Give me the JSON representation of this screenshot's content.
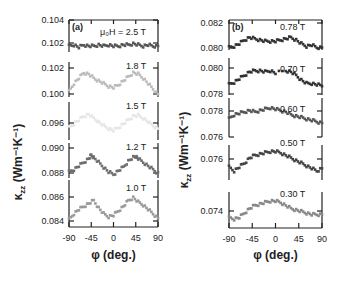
{
  "chart_data": [
    {
      "type": "scatter",
      "panel": "(a)",
      "xlabel": "φ (deg.)",
      "ylabel": "κzz (Wm⁻¹K⁻¹)",
      "xlim": [
        -90,
        90
      ],
      "xticks": [
        -90,
        -45,
        0,
        45,
        90
      ],
      "field_prefix": "μ₀H = ",
      "series": [
        {
          "name": "2.5 T",
          "color": "#555555",
          "ylim": [
            0.1015,
            0.1042
          ],
          "yticks": [
            0.104,
            0.102
          ],
          "x": [
            -90,
            -80,
            -70,
            -60,
            -50,
            -40,
            -30,
            -20,
            -10,
            0,
            10,
            20,
            30,
            40,
            50,
            60,
            70,
            80,
            90
          ],
          "y": [
            0.102,
            0.1021,
            0.1019,
            0.1021,
            0.102,
            0.102,
            0.1021,
            0.102,
            0.1021,
            0.102,
            0.102,
            0.1021,
            0.1021,
            0.1022,
            0.1021,
            0.102,
            0.1021,
            0.102,
            0.102
          ]
        },
        {
          "name": "1.8 T",
          "color": "#bbbbbb",
          "ylim": [
            0.0998,
            0.1024
          ],
          "yticks": [
            0.102,
            0.1
          ],
          "x": [
            -90,
            -80,
            -70,
            -60,
            -50,
            -40,
            -30,
            -20,
            -10,
            0,
            10,
            20,
            30,
            40,
            50,
            60,
            70,
            80,
            90
          ],
          "y": [
            0.1002,
            0.1008,
            0.1012,
            0.1016,
            0.1015,
            0.1012,
            0.101,
            0.1008,
            0.1006,
            0.1005,
            0.1007,
            0.101,
            0.1013,
            0.1016,
            0.1015,
            0.1012,
            0.1008,
            0.1004,
            0.1
          ]
        },
        {
          "name": "1.5 T",
          "color": "#e6e6e6",
          "ylim": [
            0.0945,
            0.0985
          ],
          "yticks": [
            0.096
          ],
          "x": [
            -90,
            -80,
            -70,
            -60,
            -50,
            -40,
            -30,
            -20,
            -10,
            0,
            10,
            20,
            30,
            40,
            50,
            60,
            70,
            80,
            90
          ],
          "y": [
            0.0958,
            0.0962,
            0.0966,
            0.097,
            0.0972,
            0.0968,
            0.0964,
            0.096,
            0.0957,
            0.0955,
            0.0958,
            0.0962,
            0.0966,
            0.097,
            0.0971,
            0.0968,
            0.0964,
            0.096,
            0.0957
          ]
        },
        {
          "name": "1.2 T",
          "color": "#6e6e6e",
          "ylim": [
            0.0875,
            0.0904
          ],
          "yticks": [
            0.09,
            0.088
          ],
          "x": [
            -90,
            -80,
            -70,
            -60,
            -50,
            -45,
            -40,
            -30,
            -20,
            -10,
            0,
            10,
            20,
            30,
            40,
            45,
            50,
            60,
            70,
            80,
            90
          ],
          "y": [
            0.088,
            0.0882,
            0.0885,
            0.0888,
            0.0891,
            0.0894,
            0.0892,
            0.0888,
            0.0884,
            0.088,
            0.0878,
            0.0881,
            0.0884,
            0.0889,
            0.0892,
            0.0893,
            0.0891,
            0.0888,
            0.0885,
            0.0882,
            0.0879
          ]
        },
        {
          "name": "1.0 T",
          "color": "#9a9a9a",
          "ylim": [
            0.0836,
            0.0868
          ],
          "yticks": [
            0.086,
            0.084
          ],
          "x": [
            -90,
            -80,
            -70,
            -60,
            -50,
            -40,
            -30,
            -20,
            -10,
            0,
            10,
            20,
            30,
            40,
            50,
            60,
            70,
            80,
            90
          ],
          "y": [
            0.0841,
            0.0845,
            0.0848,
            0.085,
            0.0852,
            0.0854,
            0.0849,
            0.0845,
            0.0843,
            0.0844,
            0.0847,
            0.085,
            0.0854,
            0.0856,
            0.0853,
            0.0851,
            0.0848,
            0.0845,
            0.0842
          ]
        }
      ]
    },
    {
      "type": "scatter",
      "panel": "(b)",
      "xlabel": "φ (deg.)",
      "ylabel": "κzz (Wm⁻¹K⁻¹)",
      "xlim": [
        -90,
        90
      ],
      "xticks": [
        -90,
        -45,
        0,
        45,
        90
      ],
      "series": [
        {
          "name": "0.78 T",
          "color": "#333333",
          "ylim": [
            0.0798,
            0.0822
          ],
          "yticks": [
            0.082,
            0.08
          ],
          "x": [
            -90,
            -80,
            -70,
            -60,
            -50,
            -40,
            -30,
            -20,
            -10,
            0,
            10,
            20,
            30,
            40,
            50,
            60,
            70,
            80,
            90
          ],
          "y": [
            0.08,
            0.0801,
            0.0803,
            0.0806,
            0.0808,
            0.0807,
            0.0806,
            0.0805,
            0.0805,
            0.0805,
            0.0806,
            0.0807,
            0.0808,
            0.0806,
            0.0803,
            0.0801,
            0.0802,
            0.08,
            0.08
          ]
        },
        {
          "name": "0.70 T",
          "color": "#333333",
          "ylim": [
            0.0776,
            0.0808
          ],
          "yticks": [
            0.08,
            0.078
          ],
          "x": [
            -90,
            -80,
            -70,
            -60,
            -50,
            -40,
            -30,
            -20,
            -10,
            0,
            20,
            30,
            40,
            50,
            60,
            70,
            80,
            90
          ],
          "y": [
            0.0785,
            0.0787,
            0.079,
            0.0793,
            0.0796,
            0.0797,
            0.0797,
            0.0796,
            0.0797,
            0.0795,
            0.0797,
            0.0796,
            0.0793,
            0.0789,
            0.0786,
            0.0786,
            0.0785,
            0.0784
          ]
        },
        {
          "name": "0.60 T",
          "color": "#555555",
          "ylim": [
            0.0758,
            0.0786
          ],
          "yticks": [
            0.078,
            0.076
          ],
          "x": [
            -90,
            -80,
            -70,
            -60,
            -50,
            -40,
            -30,
            -20,
            -10,
            0,
            10,
            20,
            30,
            40,
            50,
            60,
            70,
            80,
            90
          ],
          "y": [
            0.0771,
            0.0774,
            0.0775,
            0.0776,
            0.0777,
            0.0776,
            0.0777,
            0.0778,
            0.0779,
            0.0778,
            0.0777,
            0.0776,
            0.0774,
            0.0773,
            0.0772,
            0.0771,
            0.077,
            0.0769,
            0.0768
          ]
        },
        {
          "name": "0.50 T",
          "color": "#444444",
          "ylim": [
            0.0745,
            0.0772
          ],
          "yticks": [
            0.076
          ],
          "x": [
            -90,
            -80,
            -70,
            -60,
            -50,
            -40,
            -30,
            -20,
            -10,
            0,
            10,
            20,
            30,
            40,
            50,
            60,
            70,
            80,
            90
          ],
          "y": [
            0.0755,
            0.0752,
            0.0755,
            0.0758,
            0.0762,
            0.0764,
            0.0765,
            0.0766,
            0.0767,
            0.0767,
            0.0766,
            0.0764,
            0.0762,
            0.076,
            0.0758,
            0.0756,
            0.0754,
            0.0752,
            0.0754
          ]
        },
        {
          "name": "0.30 T",
          "color": "#888888",
          "ylim": [
            0.0728,
            0.0752
          ],
          "yticks": [
            0.074
          ],
          "x": [
            -90,
            -80,
            -70,
            -60,
            -50,
            -40,
            -30,
            -20,
            -10,
            0,
            10,
            20,
            30,
            40,
            50,
            60,
            70,
            80,
            90
          ],
          "y": [
            0.0735,
            0.0734,
            0.0735,
            0.0738,
            0.0741,
            0.0743,
            0.0744,
            0.0745,
            0.0746,
            0.0746,
            0.0745,
            0.0743,
            0.0741,
            0.074,
            0.0739,
            0.0738,
            0.0737,
            0.0737,
            0.0737
          ]
        }
      ]
    }
  ],
  "labels": {
    "panel_a": "(a)",
    "panel_b": "(b)",
    "field_prefix": "μ₀H = ",
    "xlabel": "φ (deg.)",
    "ylabel_main": "κ",
    "ylabel_sub": "zz",
    "ylabel_unit": " (Wm⁻¹K⁻¹)"
  }
}
